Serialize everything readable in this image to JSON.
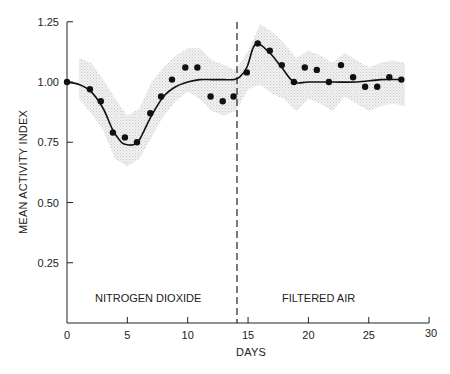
{
  "chart_data": {
    "type": "scatter",
    "title": "",
    "xlabel": "DAYS",
    "ylabel": "MEAN ACTIVITY INDEX",
    "xlim": [
      0,
      30
    ],
    "ylim": [
      0,
      1.25
    ],
    "x_ticks": [
      0,
      5,
      10,
      15,
      20,
      25,
      30
    ],
    "y_ticks": [
      0.25,
      0.5,
      0.75,
      1.0,
      1.25
    ],
    "x_tick_labels": [
      "0",
      "5",
      "10",
      "15",
      "20",
      "25",
      "30"
    ],
    "y_tick_labels": [
      "0.25",
      "0.50",
      "0.75",
      "1.00",
      "1.25"
    ],
    "grid": false,
    "legend": null,
    "annotations": [
      {
        "text": "NITROGEN DIOXIDE",
        "x": 7,
        "y": 0.1
      },
      {
        "text": "FILTERED AIR",
        "x": 21,
        "y": 0.1
      }
    ],
    "vertical_dashed_line": {
      "x": 14,
      "label": "exposure switch"
    },
    "series": [
      {
        "name": "observed",
        "type": "scatter",
        "x": [
          0,
          1.9,
          2.8,
          3.8,
          4.8,
          5.8,
          6.9,
          7.8,
          8.7,
          9.8,
          10.8,
          11.9,
          12.9,
          13.8,
          14.9,
          15.8,
          16.8,
          17.8,
          18.8,
          19.7,
          20.7,
          21.7,
          22.7,
          23.7,
          24.7,
          25.7,
          26.7,
          27.7
        ],
        "y": [
          1.0,
          0.97,
          0.92,
          0.79,
          0.77,
          0.75,
          0.87,
          0.94,
          1.01,
          1.06,
          1.06,
          0.94,
          0.92,
          0.94,
          1.04,
          1.16,
          1.13,
          1.07,
          1.0,
          1.06,
          1.05,
          1.0,
          1.07,
          1.02,
          0.98,
          0.98,
          1.02,
          1.01
        ]
      },
      {
        "name": "fitted curve",
        "type": "line",
        "x": [
          0,
          1,
          2,
          3,
          3.8,
          4.5,
          5,
          5.5,
          6,
          7,
          8,
          9,
          10,
          11,
          12,
          13,
          13.8,
          14.3,
          14.9,
          15.4,
          15.8,
          16.4,
          17,
          17.8,
          18.8,
          20,
          22,
          24,
          26,
          27.7
        ],
        "y": [
          1.0,
          0.99,
          0.96,
          0.89,
          0.8,
          0.75,
          0.74,
          0.74,
          0.76,
          0.86,
          0.94,
          0.98,
          1.0,
          1.01,
          1.01,
          1.01,
          1.01,
          1.02,
          1.06,
          1.14,
          1.16,
          1.14,
          1.11,
          1.06,
          1.0,
          1.0,
          1.0,
          1.0,
          1.01,
          1.01
        ]
      },
      {
        "name": "confidence band",
        "type": "area",
        "x": [
          1,
          2,
          3,
          4,
          5,
          6,
          7,
          8,
          9,
          10,
          11,
          12,
          13,
          14,
          15,
          16,
          17,
          18,
          19,
          20,
          21,
          22,
          23,
          24,
          25,
          26,
          27,
          28
        ],
        "upper": [
          1.1,
          1.08,
          1.01,
          0.93,
          0.86,
          0.89,
          1.0,
          1.06,
          1.11,
          1.14,
          1.14,
          1.09,
          1.07,
          1.05,
          1.13,
          1.24,
          1.21,
          1.16,
          1.1,
          1.13,
          1.11,
          1.08,
          1.12,
          1.09,
          1.06,
          1.08,
          1.09,
          1.08
        ],
        "lower": [
          0.93,
          0.87,
          0.8,
          0.68,
          0.65,
          0.68,
          0.77,
          0.86,
          0.92,
          0.96,
          0.93,
          0.88,
          0.86,
          0.88,
          0.97,
          0.99,
          0.95,
          0.93,
          0.88,
          0.93,
          0.91,
          0.88,
          0.94,
          0.91,
          0.88,
          0.9,
          0.91,
          0.9
        ]
      }
    ]
  },
  "axes": {
    "x_title": "DAYS",
    "y_title": "MEAN ACTIVITY INDEX",
    "x_tick_labels": [
      "0",
      "5",
      "10",
      "15",
      "20",
      "25",
      "30"
    ],
    "y_tick_labels": [
      "0.25",
      "0.50",
      "0.75",
      "1.00",
      "1.25"
    ]
  },
  "regions": {
    "left_label": "NITROGEN DIOXIDE",
    "right_label": "FILTERED AIR"
  }
}
